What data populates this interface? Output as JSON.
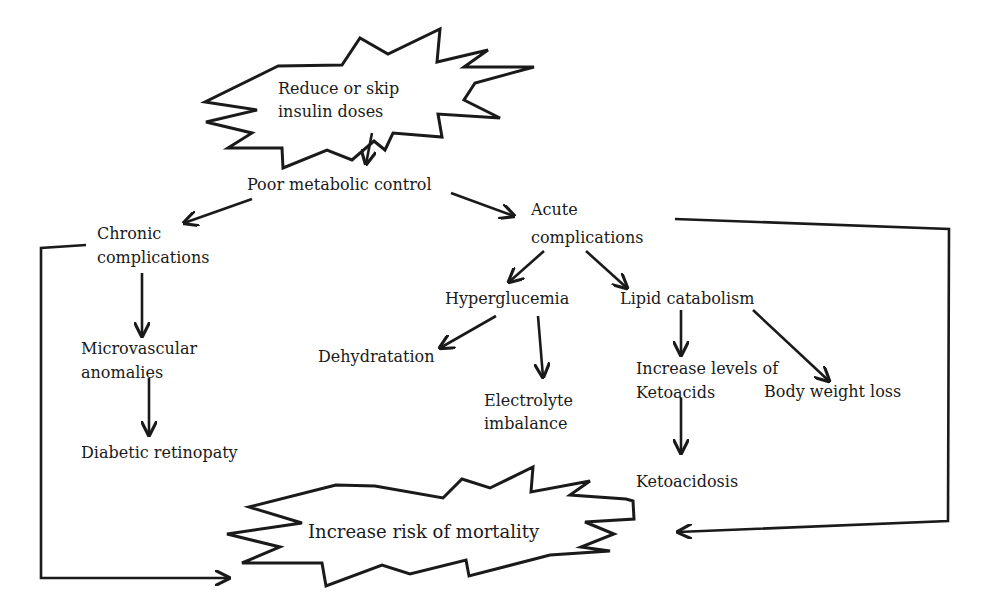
{
  "diagram": {
    "type": "flowchart",
    "colors": {
      "ink": "#1a1a1a",
      "background": "#ffffff"
    },
    "nodes": {
      "trigger": {
        "label": "Reduce or skip insulin doses",
        "lines": [
          "Reduce or skip",
          "insulin doses"
        ],
        "shape": "starburst"
      },
      "poor_control": {
        "label": "Poor metabolic control"
      },
      "chronic": {
        "label": "Chronic complications",
        "lines": [
          "Chronic",
          "complications"
        ]
      },
      "acute": {
        "label": "Acute complications",
        "lines": [
          "Acute",
          "complications"
        ]
      },
      "microvascular": {
        "label": "Microvascular anomalies",
        "lines": [
          "Microvascular",
          "anomalies"
        ]
      },
      "retinopathy": {
        "label": "Diabetic retinopaty"
      },
      "hyperglucemia": {
        "label": "Hyperglucemia"
      },
      "lipid": {
        "label": "Lipid catabolism"
      },
      "dehydration": {
        "label": "Dehydratation"
      },
      "electrolyte": {
        "label": "Electrolyte imbalance",
        "lines": [
          "Electrolyte",
          "imbalance"
        ]
      },
      "ketoacids": {
        "label": "Increase levels of Ketoacids",
        "lines": [
          "Increase levels of",
          "Ketoacids"
        ]
      },
      "weight_loss": {
        "label": "Body weight loss"
      },
      "ketoacidosis": {
        "label": "Ketoacidosis"
      },
      "mortality": {
        "label": "Increase risk of mortality",
        "shape": "starburst"
      }
    },
    "edges": [
      {
        "from": "trigger",
        "to": "poor_control"
      },
      {
        "from": "poor_control",
        "to": "chronic"
      },
      {
        "from": "poor_control",
        "to": "acute"
      },
      {
        "from": "chronic",
        "to": "microvascular"
      },
      {
        "from": "microvascular",
        "to": "retinopathy"
      },
      {
        "from": "chronic",
        "to": "mortality"
      },
      {
        "from": "acute",
        "to": "hyperglucemia"
      },
      {
        "from": "acute",
        "to": "lipid"
      },
      {
        "from": "acute",
        "to": "mortality"
      },
      {
        "from": "hyperglucemia",
        "to": "dehydration"
      },
      {
        "from": "hyperglucemia",
        "to": "electrolyte"
      },
      {
        "from": "lipid",
        "to": "ketoacids"
      },
      {
        "from": "lipid",
        "to": "weight_loss"
      },
      {
        "from": "ketoacids",
        "to": "ketoacidosis"
      }
    ]
  }
}
